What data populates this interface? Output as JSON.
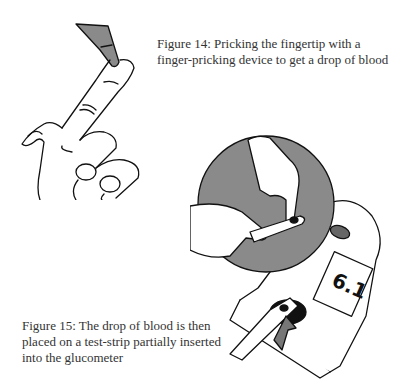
{
  "figures": [
    {
      "id": "figure-14",
      "caption": "Figure 14: Pricking the fingertip with a finger-pricking device to get a drop of blood",
      "illustration": "hand-with-finger-pricking-device"
    },
    {
      "id": "figure-15",
      "caption": "Figure 15: The drop of blood is then placed on a test-strip partially inserted into the glucometer",
      "illustration": "glucometer-with-test-strip",
      "glucometer_display": "6.1"
    }
  ],
  "colors": {
    "line": "#111111",
    "fill_gray": "#8a8a8a",
    "background": "#ffffff"
  }
}
